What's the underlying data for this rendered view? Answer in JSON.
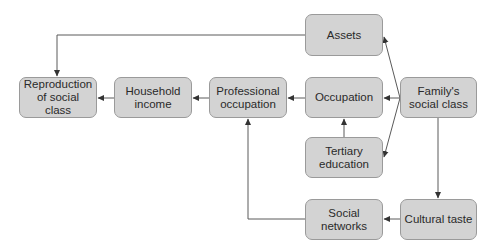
{
  "diagram": {
    "type": "flow-diagram",
    "nodes": {
      "reproduction": {
        "label": "Reproduction of social class"
      },
      "household_income": {
        "label": "Household income"
      },
      "professional_occupation": {
        "label": "Professional occupation"
      },
      "occupation": {
        "label": "Occupation"
      },
      "family_class": {
        "label": "Family's social class"
      },
      "assets": {
        "label": "Assets"
      },
      "tertiary_education": {
        "label": "Tertiary education"
      },
      "social_networks": {
        "label": "Social networks"
      },
      "cultural_taste": {
        "label": "Cultural taste"
      }
    },
    "edges": [
      {
        "from": "Family's social class",
        "to": "Assets"
      },
      {
        "from": "Family's social class",
        "to": "Occupation"
      },
      {
        "from": "Family's social class",
        "to": "Tertiary education"
      },
      {
        "from": "Family's social class",
        "to": "Cultural taste"
      },
      {
        "from": "Tertiary education",
        "to": "Occupation"
      },
      {
        "from": "Occupation",
        "to": "Professional occupation"
      },
      {
        "from": "Professional occupation",
        "to": "Household income"
      },
      {
        "from": "Household income",
        "to": "Reproduction of social class"
      },
      {
        "from": "Assets",
        "to": "Reproduction of social class"
      },
      {
        "from": "Cultural taste",
        "to": "Social networks"
      },
      {
        "from": "Social networks",
        "to": "Professional occupation"
      }
    ],
    "colors": {
      "box_fill": "#d3d3d3",
      "box_border": "#9a9a9a",
      "line": "#555555",
      "text": "#2a2a2a"
    }
  }
}
